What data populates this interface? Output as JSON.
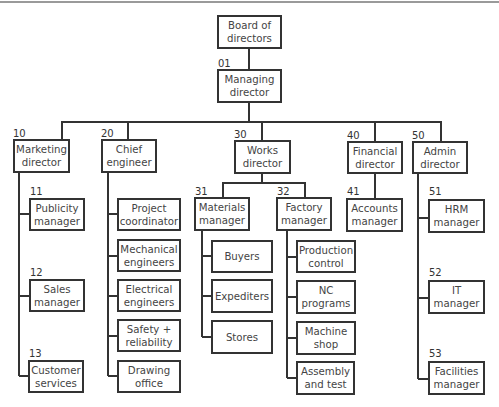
{
  "diagram": {
    "type": "organization-chart",
    "nodes": {
      "board": {
        "label": "Board of\ndirectors",
        "code": ""
      },
      "md": {
        "label": "Managing\ndirector",
        "code": "01"
      },
      "marketing": {
        "label": "Marketing\ndirector",
        "code": "10"
      },
      "chief": {
        "label": "Chief\nengineer",
        "code": "20"
      },
      "works": {
        "label": "Works\ndirector",
        "code": "30"
      },
      "financial": {
        "label": "Financial\ndirector",
        "code": "40"
      },
      "admin": {
        "label": "Admin\ndirector",
        "code": "50"
      },
      "publicity": {
        "label": "Publicity\nmanager",
        "code": "11"
      },
      "sales": {
        "label": "Sales\nmanager",
        "code": "12"
      },
      "customer": {
        "label": "Customer\nservices",
        "code": "13"
      },
      "project": {
        "label": "Project\ncoordinator"
      },
      "mechanical": {
        "label": "Mechanical\nengineers"
      },
      "electrical": {
        "label": "Electrical\nengineers"
      },
      "safety": {
        "label": "Safety +\nreliability"
      },
      "drawing": {
        "label": "Drawing\noffice"
      },
      "materials": {
        "label": "Materials\nmanager",
        "code": "31"
      },
      "factory": {
        "label": "Factory\nmanager",
        "code": "32"
      },
      "buyers": {
        "label": "Buyers"
      },
      "expediters": {
        "label": "Expediters"
      },
      "stores": {
        "label": "Stores"
      },
      "production": {
        "label": "Production\ncontrol"
      },
      "nc": {
        "label": "NC\nprograms"
      },
      "machine": {
        "label": "Machine\nshop"
      },
      "assembly": {
        "label": "Assembly\nand test"
      },
      "accounts": {
        "label": "Accounts\nmanager",
        "code": "41"
      },
      "hrm": {
        "label": "HRM\nmanager",
        "code": "51"
      },
      "it": {
        "label": "IT\nmanager",
        "code": "52"
      },
      "facilities": {
        "label": "Facilities\nmanager",
        "code": "53"
      }
    },
    "colors": {
      "line": "#333333",
      "box_border": "#333333",
      "text": "#444444",
      "top_rule": "#9a9a9a"
    }
  }
}
